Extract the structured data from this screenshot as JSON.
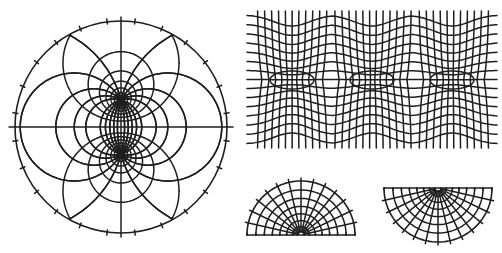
{
  "canvas": {
    "width": 502,
    "height": 253,
    "background": "#ffffff"
  },
  "style": {
    "stroke": "#1e1e1e",
    "stroke_width": 1.5,
    "outline_width": 1.6
  },
  "figures": {
    "bipolar_disk": {
      "label": "bipolar-coordinate grid in circular disk",
      "cx": 121,
      "cy": 127,
      "radius": 106,
      "foci_half_distance": 27,
      "radial_curves": 24,
      "circle_levels": [
        0.45,
        0.75,
        1.05,
        1.35,
        1.7,
        2.1,
        2.7
      ]
    },
    "periodic_strip": {
      "label": "periodic grid in rectangular strip with three elliptical sources",
      "x": 253,
      "y": 15,
      "width": 240,
      "height": 129,
      "centers_x": [
        292,
        372,
        452
      ],
      "center_y": 80,
      "vertical_lines": 34,
      "horizontal_lines": 15
    },
    "half_disk_up": {
      "label": "upper half-disk polar grid",
      "cx": 301,
      "cy": 235,
      "radius": 54,
      "radial_curves": 14,
      "arc_levels": 8,
      "orientation": "up"
    },
    "half_disk_down": {
      "label": "lower half-disk polar grid",
      "cx": 438,
      "cy": 188,
      "radius": 54,
      "radial_curves": 14,
      "arc_levels": 8,
      "orientation": "down"
    }
  }
}
